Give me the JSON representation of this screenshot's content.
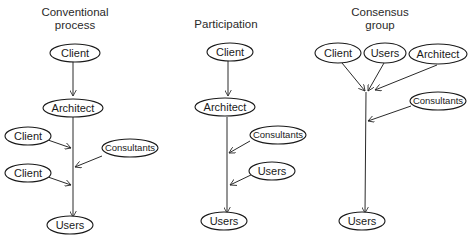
{
  "columns": [
    {
      "title_line1": "Conventional",
      "title_line2": "process",
      "nodes": {
        "top": "Client",
        "architect": "Architect",
        "left1": "Client",
        "right": "Consultants",
        "left2": "Client",
        "bottom": "Users"
      }
    },
    {
      "title_line1": "Participation",
      "nodes": {
        "top": "Client",
        "architect": "Architect",
        "right1": "Consultants",
        "right2": "Users",
        "bottom": "Users"
      }
    },
    {
      "title_line1": "Consensus",
      "title_line2": "group",
      "nodes": {
        "client": "Client",
        "users_top": "Users",
        "architect": "Architect",
        "consultants": "Consultants",
        "bottom": "Users"
      }
    }
  ]
}
